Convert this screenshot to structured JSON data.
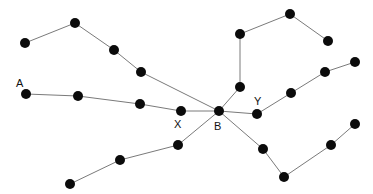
{
  "figure": {
    "background_color": "#ffffff",
    "node_color": "#0b0b0b",
    "edge_color": "#7a7a7a",
    "label_color": "#111111",
    "node_radius": 5,
    "edge_width": 1,
    "width": 373,
    "height": 194
  },
  "chart_data": {
    "type": "scatter",
    "xlabel": "",
    "ylabel": "",
    "grid": false,
    "legend": null,
    "xlim": [
      0,
      373
    ],
    "ylim": [
      0,
      194
    ],
    "nodes": [
      {
        "id": "n0",
        "label": "",
        "x": 25,
        "y": 43
      },
      {
        "id": "n1",
        "label": "",
        "x": 75,
        "y": 23
      },
      {
        "id": "n2",
        "label": "",
        "x": 114,
        "y": 50
      },
      {
        "id": "n3",
        "label": "",
        "x": 141,
        "y": 72
      },
      {
        "id": "A",
        "label": "A",
        "x": 26,
        "y": 94
      },
      {
        "id": "n5",
        "label": "",
        "x": 78,
        "y": 96
      },
      {
        "id": "n6",
        "label": "",
        "x": 140,
        "y": 104
      },
      {
        "id": "X",
        "label": "X",
        "x": 181,
        "y": 111
      },
      {
        "id": "B",
        "label": "B",
        "x": 219,
        "y": 111
      },
      {
        "id": "Y",
        "label": "Y",
        "x": 257,
        "y": 114
      },
      {
        "id": "n10",
        "label": "",
        "x": 240,
        "y": 87
      },
      {
        "id": "n11",
        "label": "",
        "x": 240,
        "y": 34
      },
      {
        "id": "n12",
        "label": "",
        "x": 290,
        "y": 14
      },
      {
        "id": "n13",
        "label": "",
        "x": 328,
        "y": 41
      },
      {
        "id": "n14",
        "label": "",
        "x": 291,
        "y": 93
      },
      {
        "id": "n15",
        "label": "",
        "x": 325,
        "y": 72
      },
      {
        "id": "n16",
        "label": "",
        "x": 355,
        "y": 62
      },
      {
        "id": "n17",
        "label": "",
        "x": 263,
        "y": 149
      },
      {
        "id": "n18",
        "label": "",
        "x": 284,
        "y": 177
      },
      {
        "id": "n19",
        "label": "",
        "x": 331,
        "y": 145
      },
      {
        "id": "n20",
        "label": "",
        "x": 355,
        "y": 124
      },
      {
        "id": "n21",
        "label": "",
        "x": 178,
        "y": 145
      },
      {
        "id": "n22",
        "label": "",
        "x": 120,
        "y": 160
      },
      {
        "id": "n23",
        "label": "",
        "x": 70,
        "y": 184
      }
    ],
    "edges": [
      {
        "from": "n0",
        "to": "n1"
      },
      {
        "from": "n1",
        "to": "n2"
      },
      {
        "from": "n2",
        "to": "n3"
      },
      {
        "from": "n3",
        "to": "B"
      },
      {
        "from": "A",
        "to": "n5"
      },
      {
        "from": "n5",
        "to": "n6"
      },
      {
        "from": "n6",
        "to": "X"
      },
      {
        "from": "X",
        "to": "B"
      },
      {
        "from": "B",
        "to": "Y"
      },
      {
        "from": "B",
        "to": "n10"
      },
      {
        "from": "n10",
        "to": "n11"
      },
      {
        "from": "n11",
        "to": "n12"
      },
      {
        "from": "n12",
        "to": "n13"
      },
      {
        "from": "Y",
        "to": "n14"
      },
      {
        "from": "n14",
        "to": "n15"
      },
      {
        "from": "n15",
        "to": "n16"
      },
      {
        "from": "B",
        "to": "n17"
      },
      {
        "from": "n17",
        "to": "n18"
      },
      {
        "from": "n18",
        "to": "n19"
      },
      {
        "from": "n19",
        "to": "n20"
      },
      {
        "from": "B",
        "to": "n21"
      },
      {
        "from": "n21",
        "to": "n22"
      },
      {
        "from": "n22",
        "to": "n23"
      }
    ],
    "labels": [
      {
        "text": "A",
        "x": 16,
        "y": 87
      },
      {
        "text": "X",
        "x": 174,
        "y": 128
      },
      {
        "text": "B",
        "x": 214,
        "y": 130
      },
      {
        "text": "Y",
        "x": 254,
        "y": 105
      }
    ]
  }
}
